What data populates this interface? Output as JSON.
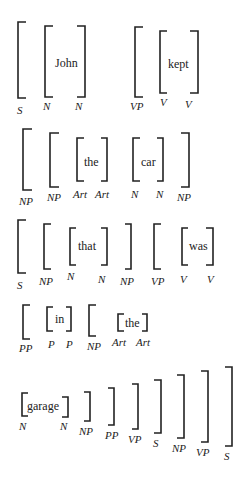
{
  "sentence": [
    "John",
    "kept",
    "the",
    "car",
    "that",
    "was",
    "in",
    "the",
    "garage"
  ],
  "rows": [
    {
      "words": [
        {
          "text": "John"
        },
        {
          "text": "kept"
        }
      ],
      "labels": [
        "S",
        "N",
        "N",
        "VP",
        "V",
        "V"
      ]
    },
    {
      "words": [
        {
          "text": "the"
        },
        {
          "text": "car"
        }
      ],
      "labels": [
        "NP",
        "NP",
        "Art",
        "Art",
        "N",
        "N",
        "NP"
      ]
    },
    {
      "words": [
        {
          "text": "that"
        },
        {
          "text": "was"
        }
      ],
      "labels": [
        "S",
        "NP",
        "N",
        "N",
        "NP",
        "VP",
        "V",
        "V"
      ]
    },
    {
      "words": [
        {
          "text": "in"
        },
        {
          "text": "the"
        }
      ],
      "labels": [
        "PP",
        "P",
        "P",
        "NP",
        "Art",
        "Art"
      ]
    },
    {
      "words": [
        {
          "text": "garage"
        }
      ],
      "labels": [
        "N",
        "N",
        "NP",
        "PP",
        "VP",
        "S",
        "NP",
        "VP",
        "S"
      ]
    }
  ]
}
